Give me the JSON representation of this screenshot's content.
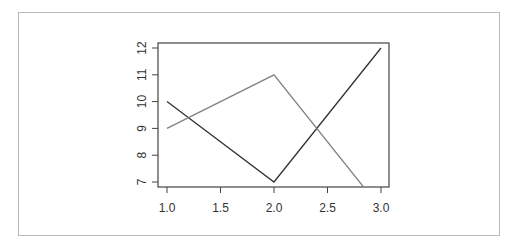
{
  "chart_data": {
    "type": "line",
    "title": "",
    "xlabel": "",
    "ylabel": "",
    "x": [
      1,
      2,
      3
    ],
    "series": [
      {
        "name": "series-1",
        "color": "#333333",
        "values": [
          10,
          7,
          12
        ]
      },
      {
        "name": "series-2",
        "color": "#808080",
        "values": [
          9,
          11,
          6
        ]
      }
    ],
    "xlim": [
      1,
      3
    ],
    "ylim": [
      6.85,
      12.15
    ],
    "xticks": [
      "1.0",
      "1.5",
      "2.0",
      "2.5",
      "3.0"
    ],
    "yticks": [
      "7",
      "8",
      "9",
      "10",
      "11",
      "12"
    ],
    "grid": false,
    "legend": null
  }
}
